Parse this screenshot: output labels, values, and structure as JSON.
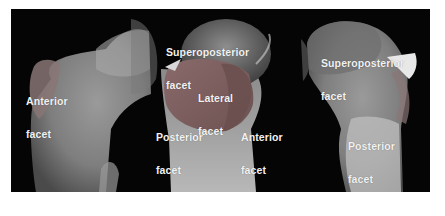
{
  "figure": {
    "background_color": "#050505",
    "views": [
      {
        "name": "left-view",
        "labels": [
          {
            "id": "anterior-facet",
            "line1": "Anterior",
            "line2": "facet"
          }
        ]
      },
      {
        "name": "middle-view",
        "labels": [
          {
            "id": "superoposterior-facet",
            "line1": "Superoposterior",
            "line2": "facet"
          },
          {
            "id": "lateral-facet",
            "line1": "Lateral",
            "line2": "facet"
          },
          {
            "id": "posterior-facet",
            "line1": "Posterior",
            "line2": "facet"
          },
          {
            "id": "anterior-facet",
            "line1": "Anterior",
            "line2": "facet"
          }
        ]
      },
      {
        "name": "right-view",
        "labels": [
          {
            "id": "superoposterior-facet",
            "line1": "Superoposterior",
            "line2": "facet"
          },
          {
            "id": "posterior-facet",
            "line1": "Posterior",
            "line2": "facet"
          }
        ]
      }
    ]
  }
}
